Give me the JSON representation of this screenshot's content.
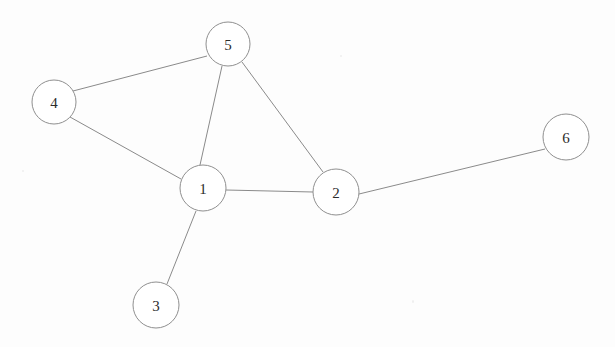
{
  "diagram": {
    "width": 615,
    "height": 347,
    "background_color": "#fdfdfd",
    "node_fill_color": "#ffffff",
    "node_stroke_color": "#8f8f8f",
    "edge_color": "#8a8a8a",
    "label_color": "#2b2b2b"
  },
  "nodes": [
    {
      "id": "1",
      "label": "1",
      "cx": 203,
      "cy": 188,
      "r": 23
    },
    {
      "id": "2",
      "label": "2",
      "cx": 336,
      "cy": 192,
      "r": 23
    },
    {
      "id": "3",
      "label": "3",
      "cx": 156,
      "cy": 305,
      "r": 23
    },
    {
      "id": "4",
      "label": "4",
      "cx": 54,
      "cy": 102,
      "r": 22
    },
    {
      "id": "5",
      "label": "5",
      "cx": 228,
      "cy": 44,
      "r": 22
    },
    {
      "id": "6",
      "label": "6",
      "cx": 566,
      "cy": 137,
      "r": 23
    }
  ],
  "edges": [
    {
      "id": "edge-4-5",
      "source": "4",
      "target": "5",
      "x1": 73,
      "y1": 91,
      "x2": 207,
      "y2": 56
    },
    {
      "id": "edge-4-1",
      "source": "4",
      "target": "1",
      "x1": 70,
      "y1": 117,
      "x2": 181,
      "y2": 179
    },
    {
      "id": "edge-5-1",
      "source": "5",
      "target": "1",
      "x1": 222,
      "y1": 66,
      "x2": 200,
      "y2": 165
    },
    {
      "id": "edge-5-2",
      "source": "5",
      "target": "2",
      "x1": 242,
      "y1": 62,
      "x2": 323,
      "y2": 172
    },
    {
      "id": "edge-1-2",
      "source": "1",
      "target": "2",
      "x1": 226,
      "y1": 190,
      "x2": 313,
      "y2": 192
    },
    {
      "id": "edge-1-3",
      "source": "1",
      "target": "3",
      "x1": 196,
      "y1": 211,
      "x2": 167,
      "y2": 284
    },
    {
      "id": "edge-2-6",
      "source": "2",
      "target": "6",
      "x1": 359,
      "y1": 194,
      "x2": 545,
      "y2": 149
    }
  ]
}
